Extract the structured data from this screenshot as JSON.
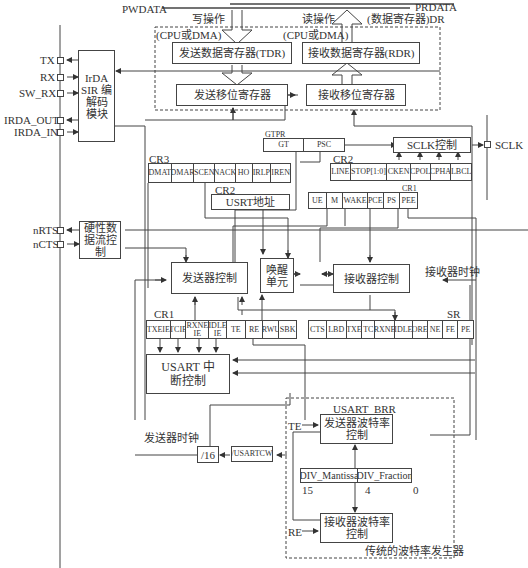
{
  "bus": {
    "pwdata": "PWDATA",
    "prdata": "PRDATA",
    "write_op": "写操作",
    "read_op": "读操作",
    "dr_label": "(数据寄存器)DR",
    "cpu_dma_left": "(CPU或DMA)",
    "cpu_dma_right": "(CPU或DMA)"
  },
  "blocks": {
    "tdr": "发送数据寄存器(TDR)",
    "rdr": "接收数据寄存器(RDR)",
    "tx_shift": "发送移位寄存器",
    "rx_shift": "接收移位寄存器",
    "irda": "IrDA SIR 编解码 模块",
    "sclk_ctrl": "SCLK控制",
    "usart_addr": "USRT地址",
    "hw_flow": "硬性数 据流控制",
    "tx_ctrl": "发送器控制",
    "wakeup": "唤醒 单元",
    "rx_ctrl": "接收器控制",
    "int_ctrl": "USART 中断控制",
    "div16": "/16",
    "usartcw": "/USARTCW",
    "tx_baud": "发送器波特率 控制",
    "rx_baud": "接收器波特率 控制"
  },
  "pins": {
    "tx": "TX",
    "rx": "RX",
    "sw_rx": "SW_RX",
    "irda_out": "IRDA_OUT",
    "irda_in": "IRDA_IN",
    "nrts": "nRTS",
    "ncts": "nCTS",
    "sclk": "SCLK"
  },
  "labels": {
    "gtpr": "GTPR",
    "cr3": "CR3",
    "cr2_top": "CR2",
    "cr2_addr": "CR2",
    "cr1_top": "CR1",
    "cr1_bottom": "CR1",
    "sr": "SR",
    "usart_brr": "USART_BRR",
    "rx_clock": "接收器时钟",
    "tx_clock": "发送器时钟",
    "te": "TE",
    "re": "RE",
    "bit15": "15",
    "bit4": "4",
    "bit0": "0",
    "baud_gen": "传统的波特率发生器"
  },
  "registers": {
    "gtpr": [
      "GT",
      "PSC"
    ],
    "cr3": [
      "DMAT",
      "DMAR",
      "SCEN",
      "NACK",
      "HO",
      "IRLP",
      "IREN"
    ],
    "cr2": [
      "LINE",
      "STOP[1:0]",
      "CKEN",
      "CPOL",
      "CPHA",
      "LBCL"
    ],
    "cr1_top": [
      "UE",
      "M",
      "WAKE",
      "PCE",
      "PS",
      "PEE"
    ],
    "cr1_bottom": [
      "TXEIE",
      "TCIE",
      "RXNE IE",
      "IDLE IE",
      "TE",
      "RE",
      "RWU",
      "SBK"
    ],
    "sr": [
      "CTS",
      "LBD",
      "TXE",
      "TC",
      "RXNE",
      "IDLE",
      "ORE",
      "NE",
      "FE",
      "PE"
    ],
    "brr": [
      "DIV_Mantissa",
      "DIV_Fraction"
    ]
  }
}
